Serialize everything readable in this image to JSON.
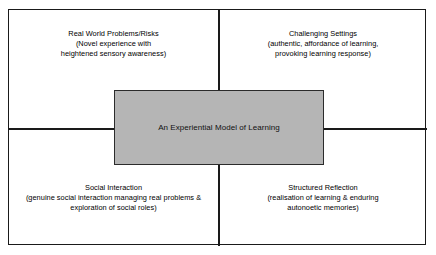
{
  "diagram": {
    "title": "An Experiential Model of Learning",
    "type": "2x2 quadrant model",
    "center": {
      "label": "An Experiential Model of Learning",
      "fill_color": "#b5b5b5",
      "border_color": "#2b2b2b"
    },
    "frame": {
      "border_color": "#1a1a1a",
      "background_color": "#ffffff"
    },
    "quadrants": [
      {
        "position": "top-left",
        "heading": "Real World Problems/Risks",
        "description_lines": [
          "(Novel experience with",
          "heightened sensory awareness)"
        ]
      },
      {
        "position": "top-right",
        "heading": "Challenging Settings",
        "description_lines": [
          "(authentic, affordance of learning,",
          "provoking learning response)"
        ]
      },
      {
        "position": "bottom-left",
        "heading": "Social Interaction",
        "description_lines": [
          "(genuine social interaction managing real problems &",
          "exploration of social roles)"
        ]
      },
      {
        "position": "bottom-right",
        "heading": "Structured Reflection",
        "description_lines": [
          "(realisation of learning & enduring",
          "autonoetic memories)"
        ]
      }
    ]
  }
}
